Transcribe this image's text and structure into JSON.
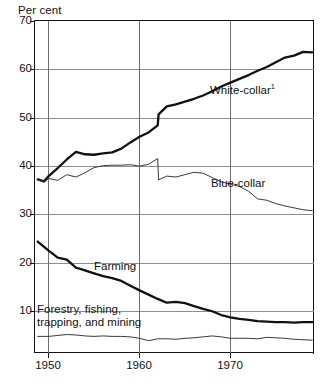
{
  "axis_title": "Per cent",
  "yaxis": {
    "label": "Per cent",
    "ticks": [
      70,
      60,
      50,
      40,
      30,
      20,
      10
    ],
    "tick_labels": [
      "70",
      "60",
      "50",
      "40",
      "30",
      "20",
      "10"
    ],
    "min": 0,
    "max": 70,
    "gridlines": true
  },
  "xaxis": {
    "ticks": [
      1950,
      1960,
      1970
    ],
    "tick_labels": [
      "1950",
      "1960",
      "1970"
    ],
    "min": 1946.5,
    "max": 1977.2,
    "gridlines": true
  },
  "series_labels": {
    "white_collar": "White-collar",
    "white_collar_footnote": "1",
    "blue_collar": "Blue-collar",
    "farming": "Farming",
    "forestry_line1": "Forestry, fishing,",
    "forestry_line2": "trapping, and mining"
  },
  "colors": {
    "axis": "#141414",
    "grid_horizontal": "#8d8d8d",
    "grid_vertical": "#6f6f6f",
    "thick_line": "#111111",
    "thin_line": "#3a3a3a",
    "background": "#ffffff"
  },
  "chart_data": {
    "type": "line",
    "title": "",
    "subtitle": "",
    "xlabel": "",
    "ylabel": "Per cent",
    "xlim": [
      1946.5,
      1977.2
    ],
    "ylim": [
      0,
      70
    ],
    "grid": true,
    "legend": "inline-labels",
    "yticks": [
      10,
      20,
      30,
      40,
      50,
      60,
      70
    ],
    "xticks": [
      1950,
      1960,
      1970
    ],
    "footnotes": [
      "1"
    ],
    "series": [
      {
        "name": "White-collar",
        "footnote": "1",
        "style": "thick",
        "x": [
          1946.8,
          1947.5,
          1948,
          1949,
          1950,
          1951,
          1952,
          1953,
          1954,
          1955,
          1956,
          1957,
          1958,
          1959,
          1960,
          1960.1,
          1961,
          1962,
          1963,
          1964,
          1965,
          1966,
          1967,
          1968,
          1969,
          1970,
          1971,
          1972,
          1973,
          1974,
          1975,
          1976,
          1977
        ],
        "values": [
          36.6,
          36.2,
          37.3,
          39.0,
          40.8,
          42.4,
          41.9,
          41.8,
          42.1,
          42.3,
          43.1,
          44.4,
          45.6,
          46.5,
          48.0,
          50.3,
          52.0,
          52.4,
          53.0,
          53.6,
          54.3,
          55.2,
          56.2,
          57.0,
          57.8,
          58.6,
          59.5,
          60.3,
          61.3,
          62.3,
          62.7,
          63.5,
          63.4
        ]
      },
      {
        "name": "Blue-collar",
        "style": "thin",
        "x": [
          1946.8,
          1947.5,
          1948,
          1949,
          1950,
          1951,
          1952,
          1953,
          1954,
          1955,
          1956,
          1957,
          1958,
          1959,
          1960,
          1960.1,
          1961,
          1962,
          1963,
          1964,
          1965,
          1966,
          1967,
          1968,
          1969,
          1970,
          1971,
          1972,
          1973,
          1974,
          1975,
          1976,
          1977
        ],
        "values": [
          36.5,
          36.0,
          36.8,
          36.4,
          37.6,
          37.1,
          38.0,
          39.1,
          39.5,
          39.6,
          39.6,
          39.7,
          39.4,
          39.8,
          41.0,
          36.5,
          37.3,
          37.1,
          37.6,
          38.1,
          37.9,
          37.0,
          36.1,
          35.6,
          35.1,
          34.1,
          32.5,
          32.2,
          31.5,
          31.0,
          30.6,
          30.2,
          30.0
        ]
      },
      {
        "name": "Farming",
        "style": "thick",
        "x": [
          1946.8,
          1948,
          1949,
          1950,
          1951,
          1952,
          1953,
          1954,
          1955,
          1956,
          1957,
          1958,
          1959,
          1960,
          1961,
          1962,
          1963,
          1964,
          1965,
          1966,
          1967,
          1968,
          1969,
          1970,
          1971,
          1972,
          1973,
          1974,
          1975,
          1976,
          1977
        ],
        "values": [
          23.5,
          21.6,
          20.1,
          19.7,
          18.0,
          17.4,
          16.8,
          16.2,
          15.8,
          15.2,
          14.2,
          13.2,
          12.3,
          11.4,
          10.6,
          10.8,
          10.5,
          9.9,
          9.3,
          8.8,
          8.0,
          7.5,
          7.2,
          7.0,
          6.7,
          6.6,
          6.5,
          6.5,
          6.4,
          6.5,
          6.5
        ]
      },
      {
        "name": "Forestry, fishing, trapping, and mining",
        "style": "thin",
        "x": [
          1946.8,
          1948,
          1949,
          1950,
          1951,
          1952,
          1953,
          1954,
          1955,
          1956,
          1957,
          1958,
          1959,
          1960,
          1961,
          1962,
          1963,
          1964,
          1965,
          1966,
          1967,
          1968,
          1969,
          1970,
          1971,
          1972,
          1973,
          1974,
          1975,
          1976,
          1977
        ],
        "values": [
          3.5,
          3.5,
          3.7,
          3.9,
          3.8,
          3.6,
          3.5,
          3.6,
          3.5,
          3.5,
          3.4,
          3.1,
          2.6,
          3.0,
          3.0,
          2.9,
          3.1,
          3.2,
          3.4,
          3.6,
          3.4,
          3.1,
          3.1,
          3.1,
          3.0,
          3.3,
          3.2,
          3.1,
          2.9,
          2.8,
          2.7
        ]
      }
    ]
  }
}
